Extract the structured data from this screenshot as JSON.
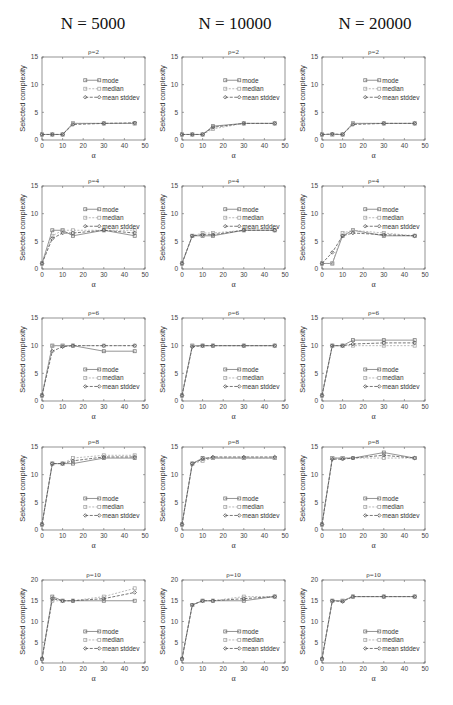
{
  "column_titles": [
    "N = 5000",
    "N = 10000",
    "N = 20000"
  ],
  "chart_data": {
    "type": "line",
    "xlabel": "α",
    "ylabel": "Selected complexity",
    "x": [
      0,
      5,
      10,
      15,
      30,
      45
    ],
    "xlim": [
      0,
      50
    ],
    "xticks": [
      0,
      10,
      20,
      30,
      40,
      50
    ],
    "legend": [
      "mode",
      "median",
      "mean stddev"
    ],
    "series_colors": {
      "mode": "#7a7a7a",
      "median": "#a8a8a8",
      "mean stddev": "#555555"
    },
    "panels": [
      {
        "N": 5000,
        "title": "ρ=2",
        "ylim": [
          0,
          15
        ],
        "yticks": [
          0,
          5,
          10,
          15
        ],
        "legend_pos": "upper-middle",
        "series": [
          {
            "name": "mode",
            "values": [
              1,
              1,
              1,
              3,
              3,
              3
            ]
          },
          {
            "name": "median",
            "values": [
              1,
              1,
              1,
              3,
              3,
              3
            ]
          },
          {
            "name": "mean stddev",
            "values": [
              1,
              1,
              1,
              2.8,
              3,
              3.1
            ]
          }
        ]
      },
      {
        "N": 10000,
        "title": "ρ=2",
        "ylim": [
          0,
          15
        ],
        "yticks": [
          0,
          5,
          10,
          15
        ],
        "legend_pos": "upper-middle",
        "series": [
          {
            "name": "mode",
            "values": [
              1,
              1,
              1,
              2.5,
              3,
              3
            ]
          },
          {
            "name": "median",
            "values": [
              1,
              1,
              1,
              2,
              3,
              3
            ]
          },
          {
            "name": "mean stddev",
            "values": [
              1,
              1,
              1,
              2.3,
              3,
              3
            ]
          }
        ]
      },
      {
        "N": 20000,
        "title": "ρ=2",
        "ylim": [
          0,
          15
        ],
        "yticks": [
          0,
          5,
          10,
          15
        ],
        "legend_pos": "upper-middle",
        "series": [
          {
            "name": "mode",
            "values": [
              1,
              1,
              1,
              3,
              3,
              3
            ]
          },
          {
            "name": "median",
            "values": [
              1,
              1,
              1,
              3,
              3,
              3
            ]
          },
          {
            "name": "mean stddev",
            "values": [
              1,
              1.1,
              1,
              2.8,
              3,
              3
            ]
          }
        ]
      },
      {
        "N": 5000,
        "title": "ρ=4",
        "ylim": [
          0,
          15
        ],
        "yticks": [
          0,
          5,
          10,
          15
        ],
        "legend_pos": "upper-middle",
        "series": [
          {
            "name": "mode",
            "values": [
              1,
              7,
              7,
              6,
              7,
              6
            ]
          },
          {
            "name": "median",
            "values": [
              1,
              6,
              7,
              7,
              7,
              7
            ]
          },
          {
            "name": "mean stddev",
            "values": [
              1,
              5.5,
              6.5,
              6.5,
              7,
              6.5
            ]
          }
        ]
      },
      {
        "N": 10000,
        "title": "ρ=4",
        "ylim": [
          0,
          15
        ],
        "yticks": [
          0,
          5,
          10,
          15
        ],
        "legend_pos": "upper-middle",
        "series": [
          {
            "name": "mode",
            "values": [
              1,
              6,
              6,
              6,
              7,
              7
            ]
          },
          {
            "name": "median",
            "values": [
              1,
              6,
              6.5,
              6.5,
              7,
              7
            ]
          },
          {
            "name": "mean stddev",
            "values": [
              1,
              6,
              6.2,
              6.2,
              7,
              7
            ]
          }
        ]
      },
      {
        "N": 20000,
        "title": "ρ=4",
        "ylim": [
          0,
          15
        ],
        "yticks": [
          0,
          5,
          10,
          15
        ],
        "legend_pos": "upper-middle",
        "series": [
          {
            "name": "mode",
            "values": [
              1,
              1,
              6,
              7,
              6,
              6
            ]
          },
          {
            "name": "median",
            "values": [
              1,
              1,
              6.5,
              7,
              6.5,
              6
            ]
          },
          {
            "name": "mean stddev",
            "values": [
              1,
              3,
              6,
              6.5,
              6.2,
              6
            ]
          }
        ]
      },
      {
        "N": 5000,
        "title": "ρ=6",
        "ylim": [
          0,
          15
        ],
        "yticks": [
          0,
          5,
          10,
          15
        ],
        "legend_pos": "lower-middle",
        "series": [
          {
            "name": "mode",
            "values": [
              1,
              10,
              10,
              10,
              9,
              9
            ]
          },
          {
            "name": "median",
            "values": [
              1,
              10,
              10,
              10,
              10,
              10
            ]
          },
          {
            "name": "mean stddev",
            "values": [
              1,
              9,
              9.8,
              10,
              10,
              10
            ]
          }
        ]
      },
      {
        "N": 10000,
        "title": "ρ=6",
        "ylim": [
          0,
          15
        ],
        "yticks": [
          0,
          5,
          10,
          15
        ],
        "legend_pos": "lower-middle",
        "series": [
          {
            "name": "mode",
            "values": [
              1,
              10,
              10,
              10,
              10,
              10
            ]
          },
          {
            "name": "median",
            "values": [
              1,
              10,
              10,
              10,
              10,
              10
            ]
          },
          {
            "name": "mean stddev",
            "values": [
              1,
              9.8,
              10,
              10,
              10,
              10
            ]
          }
        ]
      },
      {
        "N": 20000,
        "title": "ρ=6",
        "ylim": [
          0,
          15
        ],
        "yticks": [
          0,
          5,
          10,
          15
        ],
        "legend_pos": "lower-middle",
        "series": [
          {
            "name": "mode",
            "values": [
              1,
              10,
              10,
              11,
              11,
              11
            ]
          },
          {
            "name": "median",
            "values": [
              1,
              10,
              10,
              10,
              10,
              10
            ]
          },
          {
            "name": "mean stddev",
            "values": [
              1,
              10,
              10,
              10.3,
              10.5,
              10.5
            ]
          }
        ]
      },
      {
        "N": 5000,
        "title": "ρ=8",
        "ylim": [
          0,
          15
        ],
        "yticks": [
          0,
          5,
          10,
          15
        ],
        "legend_pos": "lower-middle",
        "series": [
          {
            "name": "mode",
            "values": [
              1,
              12,
              12,
              12,
              13,
              13
            ]
          },
          {
            "name": "median",
            "values": [
              1,
              12,
              12,
              13,
              13.5,
              13.5
            ]
          },
          {
            "name": "mean stddev",
            "values": [
              1,
              12,
              12,
              12.5,
              13.2,
              13.2
            ]
          }
        ]
      },
      {
        "N": 10000,
        "title": "ρ=8",
        "ylim": [
          0,
          15
        ],
        "yticks": [
          0,
          5,
          10,
          15
        ],
        "legend_pos": "lower-middle",
        "series": [
          {
            "name": "mode",
            "values": [
              1,
              12,
              13,
              13,
              13,
              13
            ]
          },
          {
            "name": "median",
            "values": [
              1,
              12,
              12.5,
              13,
              13,
              13
            ]
          },
          {
            "name": "mean stddev",
            "values": [
              1,
              12,
              12.8,
              13.2,
              13.2,
              13.2
            ]
          }
        ]
      },
      {
        "N": 20000,
        "title": "ρ=8",
        "ylim": [
          0,
          15
        ],
        "yticks": [
          0,
          5,
          10,
          15
        ],
        "legend_pos": "lower-middle",
        "series": [
          {
            "name": "mode",
            "values": [
              1,
              13,
              13,
              13,
              14,
              13
            ]
          },
          {
            "name": "median",
            "values": [
              1,
              13,
              13,
              13,
              13,
              13
            ]
          },
          {
            "name": "mean stddev",
            "values": [
              1,
              12.8,
              12.8,
              13,
              13.5,
              13
            ]
          }
        ]
      },
      {
        "N": 5000,
        "title": "ρ=10",
        "ylim": [
          0,
          20
        ],
        "yticks": [
          0,
          5,
          10,
          15,
          20
        ],
        "legend_pos": "lower-middle",
        "series": [
          {
            "name": "mode",
            "values": [
              1,
              16,
              15,
              15,
              15,
              15
            ]
          },
          {
            "name": "median",
            "values": [
              1,
              15,
              15,
              15,
              16,
              18
            ]
          },
          {
            "name": "mean stddev",
            "values": [
              1,
              15.5,
              15,
              15,
              15.5,
              17
            ]
          }
        ]
      },
      {
        "N": 10000,
        "title": "ρ=10",
        "ylim": [
          0,
          20
        ],
        "yticks": [
          0,
          5,
          10,
          15,
          20
        ],
        "legend_pos": "lower-middle",
        "series": [
          {
            "name": "mode",
            "values": [
              1,
              14,
              15,
              15,
              15,
              16
            ]
          },
          {
            "name": "median",
            "values": [
              1,
              14,
              15,
              15,
              16,
              16
            ]
          },
          {
            "name": "mean stddev",
            "values": [
              1,
              14,
              15,
              15,
              15.5,
              16
            ]
          }
        ]
      },
      {
        "N": 20000,
        "title": "ρ=10",
        "ylim": [
          0,
          20
        ],
        "yticks": [
          0,
          5,
          10,
          15,
          20
        ],
        "legend_pos": "lower-middle",
        "series": [
          {
            "name": "mode",
            "values": [
              1,
              15,
              15,
              16,
              16,
              16
            ]
          },
          {
            "name": "median",
            "values": [
              1,
              15,
              15,
              16,
              16,
              16
            ]
          },
          {
            "name": "mean stddev",
            "values": [
              1,
              15,
              14.8,
              16,
              16,
              16
            ]
          }
        ]
      }
    ]
  }
}
